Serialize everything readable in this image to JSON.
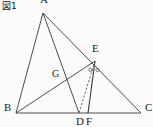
{
  "figure": {
    "caption": "図1",
    "caption_reading": "Figure 1",
    "background_color": "#fbfbfa",
    "stroke_color": "#3a3a3a",
    "label_color": "#1a1a1a",
    "width": 153,
    "height": 127
  },
  "labels": {
    "A": "A",
    "B": "B",
    "C": "C",
    "D": "D",
    "E": "E",
    "F": "F",
    "G": "G"
  },
  "chart_data": {
    "type": "diagram",
    "title": "図1",
    "points": [
      {
        "name": "A",
        "x": 43,
        "y": 13,
        "label_dx": -3,
        "label_dy": -12
      },
      {
        "name": "B",
        "x": 16,
        "y": 113,
        "label_dx": -12,
        "label_dy": -4
      },
      {
        "name": "C",
        "x": 141,
        "y": 113,
        "label_dx": 4,
        "label_dy": -4
      },
      {
        "name": "D",
        "x": 79,
        "y": 113,
        "label_dx": -3,
        "label_dy": 10
      },
      {
        "name": "E",
        "x": 95,
        "y": 61,
        "label_dx": -3,
        "label_dy": -11
      },
      {
        "name": "F",
        "x": 88,
        "y": 113,
        "label_dx": -2,
        "label_dy": 10
      },
      {
        "name": "G",
        "x": 62,
        "y": 76,
        "label_dx": -10,
        "label_dy": -1
      }
    ],
    "segments": [
      {
        "name": "AB",
        "from": "A",
        "to": "B",
        "style": "solid"
      },
      {
        "name": "AC",
        "from": "A",
        "to": "C",
        "style": "solid"
      },
      {
        "name": "BC",
        "from": "B",
        "to": "C",
        "style": "solid"
      },
      {
        "name": "AD",
        "from": "A",
        "to": "D",
        "style": "solid"
      },
      {
        "name": "BE",
        "from": "B",
        "to": "E",
        "style": "solid"
      },
      {
        "name": "EF",
        "from": "E",
        "to": "F",
        "style": "solid"
      },
      {
        "name": "ED",
        "from": "E",
        "to": "D",
        "style": "dashed"
      }
    ],
    "angle_marks": [
      {
        "name": "angle-DEF",
        "vertex": "E",
        "mark": "circle",
        "count": 1
      },
      {
        "name": "angle-FEC",
        "vertex": "E",
        "mark": "circle",
        "count": 1
      }
    ]
  }
}
